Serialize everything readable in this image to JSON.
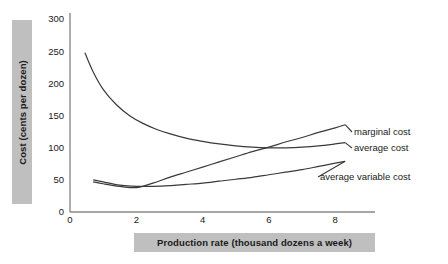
{
  "chart_data": {
    "type": "line",
    "title": "",
    "xlabel": "Production rate (thousand dozens a week)",
    "ylabel": "Cost (cents per dozen)",
    "xlim": [
      0,
      9.2
    ],
    "ylim": [
      0,
      310
    ],
    "xticks": [
      0,
      2,
      4,
      6,
      8
    ],
    "xtick_labels": [
      "0",
      "2",
      "4",
      "6",
      "8"
    ],
    "yticks": [
      0,
      50,
      100,
      150,
      200,
      250,
      300
    ],
    "ytick_labels": [
      "0",
      "50",
      "100",
      "150",
      "200",
      "250",
      "300"
    ],
    "grid": false,
    "legend": "inline-right-labels",
    "line_color": "#3a3a3a",
    "axis_color": "#8a8a8a",
    "label_band_color": "#bfbfbf",
    "series": [
      {
        "name": "average cost",
        "label": "average cost",
        "x": [
          0.45,
          0.7,
          1.0,
          1.4,
          1.8,
          2.2,
          2.6,
          3.0,
          3.5,
          4.0,
          4.5,
          5.0,
          5.5,
          6.0,
          6.5,
          7.0,
          7.5,
          8.0,
          8.3
        ],
        "y": [
          248,
          218,
          191,
          167,
          150,
          138,
          129,
          122,
          115,
          110,
          106,
          103,
          101,
          100,
          100,
          101,
          103,
          106,
          108
        ]
      },
      {
        "name": "marginal cost",
        "label": "marginal cost",
        "x": [
          0.7,
          1.0,
          1.5,
          2.0,
          2.5,
          3.0,
          3.5,
          4.0,
          4.5,
          5.0,
          5.5,
          6.0,
          6.5,
          7.0,
          7.5,
          8.0,
          8.3
        ],
        "y": [
          47,
          44,
          40,
          38,
          45,
          54,
          62,
          70,
          78,
          86,
          94,
          101,
          109,
          116,
          124,
          131,
          136
        ]
      },
      {
        "name": "average variable cost",
        "label": "average variable cost",
        "x": [
          0.7,
          1.0,
          1.5,
          2.0,
          2.5,
          3.0,
          3.5,
          4.0,
          4.5,
          5.0,
          5.5,
          6.0,
          6.5,
          7.0,
          7.5,
          8.0,
          8.3
        ],
        "y": [
          50,
          47,
          42,
          40,
          40,
          41,
          43,
          45,
          48,
          51,
          54,
          58,
          62,
          66,
          71,
          76,
          79
        ]
      }
    ]
  }
}
